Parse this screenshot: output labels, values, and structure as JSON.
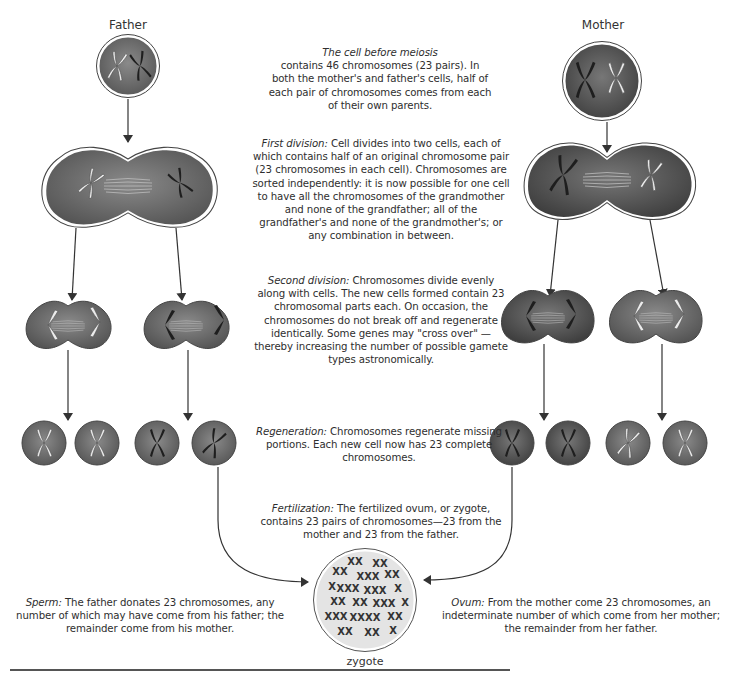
{
  "labels": {
    "father": "Father",
    "mother": "Mother",
    "zygote": "zygote"
  },
  "captions": {
    "before_meiosis": {
      "term": "The cell before meiosis",
      "text": "contains 46 chromosomes (23 pairs). In both the mother's and father's cells, half of each pair of chromosomes comes from each of their own parents."
    },
    "first_division": {
      "term": "First division:",
      "text": " Cell divides into two cells, each of which contains half of an original chromosome pair (23 chromosomes in each cell). Chromosomes are sorted independently: it is now possible for one cell to have all the chromosomes of the grandmother and none of the grandfather; all of the grandfather's and none of the grandmother's; or any combination in between."
    },
    "second_division": {
      "term": "Second division:",
      "text": " Chromosomes divide evenly along with cells. The new cells formed contain 23 chromosomal parts each. On occasion, the chromosomes do not break off and regenerate identically. Some genes may \"cross over\" —thereby increasing the number of possible gamete types astronomically."
    },
    "regeneration": {
      "term": "Regeneration:",
      "text": " Chromosomes regenerate missing portions. Each new cell now has 23 complete chromosomes."
    },
    "fertilization": {
      "term": "Fertilization:",
      "text": " The fertilized ovum, or zygote, contains 23 pairs of chromosomes—23 from the mother and 23 from the father."
    },
    "sperm": {
      "term": "Sperm:",
      "text": " The father donates 23 chromosomes, any number of which may have come from his father; the remainder come from his mother."
    },
    "ovum": {
      "term": "Ovum:",
      "text": " From the mother come 23 chromosomes, an indeterminate number of which come from her mother; the remainder from her father."
    }
  },
  "colors": {
    "cell_fill": "#6e6e6e",
    "cell_outline": "#444444",
    "chromosome_dark": "#1e1e1e",
    "chromosome_light": "#e8e8e8",
    "zygote_fill": "#e6e6e6",
    "arrow": "#333333"
  }
}
